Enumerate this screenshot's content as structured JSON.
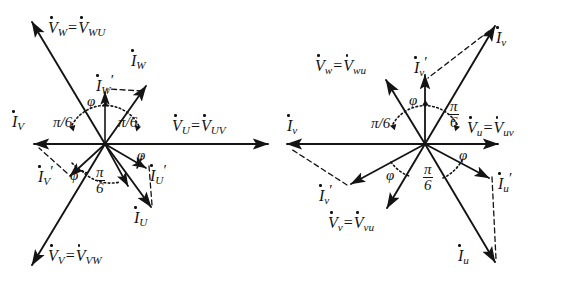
{
  "figure": {
    "background_color": "#ffffff",
    "ink_color": "#141414",
    "type": "phasor-diagram-pair"
  },
  "symbols": {
    "phi": "φ",
    "pi": "π",
    "equals": "=",
    "prime": "′",
    "pi_over_6_inline": "π/6",
    "fraction_numerator": "π",
    "fraction_denominator": "6"
  },
  "left_diagram": {
    "name": "delta-connection-phasor-diagram",
    "origin": {
      "x": 105,
      "y": 144
    },
    "voltage_labels": [
      {
        "id": "V_W",
        "base": "V",
        "sub": "W",
        "eq": "=",
        "base2": "V",
        "sub2": "WU",
        "x": 48,
        "y": 20
      },
      {
        "id": "V_U",
        "base": "V",
        "sub": "U",
        "eq": "=",
        "base2": "V",
        "sub2": "UV",
        "x": 172,
        "y": 118
      },
      {
        "id": "V_V",
        "base": "V",
        "sub": "V",
        "eq": "=",
        "base2": "V",
        "sub2": "VW",
        "x": 48,
        "y": 248
      }
    ],
    "current_labels": [
      {
        "id": "I_W",
        "base": "I",
        "sub": "W",
        "prime": "",
        "x": 131,
        "y": 53
      },
      {
        "id": "I_Wp",
        "base": "I",
        "sub": "W",
        "prime": "′",
        "x": 96,
        "y": 72
      },
      {
        "id": "I_V",
        "base": "I",
        "sub": "V",
        "prime": "",
        "x": 12,
        "y": 114
      },
      {
        "id": "I_Vp",
        "base": "I",
        "sub": "V",
        "prime": "′",
        "x": 38,
        "y": 163
      },
      {
        "id": "I_Up",
        "base": "I",
        "sub": "U",
        "prime": "′",
        "x": 150,
        "y": 162
      },
      {
        "id": "I_U",
        "base": "I",
        "sub": "U",
        "prime": "",
        "x": 134,
        "y": 210
      }
    ],
    "angle_labels": [
      {
        "id": "pi6-left-top",
        "text": "π/6",
        "kind": "inline",
        "x": 53,
        "y": 115
      },
      {
        "id": "pi6-right-top",
        "text": "π/6",
        "kind": "inline",
        "x": 118,
        "y": 115
      },
      {
        "id": "pi6-bottom",
        "text": "π/6",
        "kind": "fraction",
        "x": 95,
        "y": 166
      },
      {
        "id": "phi-upper",
        "text": "φ",
        "kind": "phi",
        "x": 87,
        "y": 94
      },
      {
        "id": "phi-lower-left",
        "text": "φ",
        "kind": "phi",
        "x": 70,
        "y": 168
      },
      {
        "id": "phi-lower-right",
        "text": "φ",
        "kind": "phi",
        "x": 137,
        "y": 148
      }
    ]
  },
  "right_diagram": {
    "name": "star-connection-phasor-diagram",
    "origin": {
      "x": 142,
      "y": 144
    },
    "voltage_labels": [
      {
        "id": "V_w",
        "base": "V",
        "sub": "w",
        "eq": "=",
        "base2": "V",
        "sub2": "wu",
        "x": 32,
        "y": 58
      },
      {
        "id": "V_u",
        "base": "V",
        "sub": "u",
        "eq": "=",
        "base2": "V",
        "sub2": "uv",
        "x": 184,
        "y": 120
      },
      {
        "id": "V_v",
        "base": "V",
        "sub": "v",
        "eq": "=",
        "base2": "V",
        "sub2": "vu",
        "x": 45,
        "y": 215
      }
    ],
    "current_labels": [
      {
        "id": "I_v_top",
        "base": "I",
        "sub": "v",
        "prime": "",
        "x": 213,
        "y": 30
      },
      {
        "id": "I_vp_top",
        "base": "I",
        "sub": "v",
        "prime": "′",
        "x": 131,
        "y": 54
      },
      {
        "id": "I_v_left",
        "base": "I",
        "sub": "v",
        "prime": "",
        "x": 4,
        "y": 118
      },
      {
        "id": "I_vp_low",
        "base": "I",
        "sub": "v",
        "prime": "′",
        "x": 36,
        "y": 182
      },
      {
        "id": "I_up",
        "base": "I",
        "sub": "u",
        "prime": "′",
        "x": 215,
        "y": 170
      },
      {
        "id": "I_u",
        "base": "I",
        "sub": "u",
        "prime": "",
        "x": 175,
        "y": 248
      }
    ],
    "angle_labels": [
      {
        "id": "pi6-left",
        "text": "π/6",
        "kind": "inline",
        "x": 88,
        "y": 116
      },
      {
        "id": "pi6-right",
        "text": "π/6",
        "kind": "fraction",
        "x": 166,
        "y": 100
      },
      {
        "id": "pi6-bottom",
        "text": "π/6",
        "kind": "fraction",
        "x": 140,
        "y": 163
      },
      {
        "id": "phi-top",
        "text": "φ",
        "kind": "phi",
        "x": 126,
        "y": 93
      },
      {
        "id": "phi-left",
        "text": "φ",
        "kind": "phi",
        "x": 103,
        "y": 168
      },
      {
        "id": "phi-right",
        "text": "φ",
        "kind": "phi",
        "x": 176,
        "y": 148
      }
    ]
  }
}
